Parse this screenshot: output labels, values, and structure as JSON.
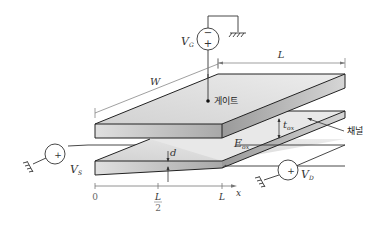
{
  "diagram": {
    "gate": {
      "label": "게이트",
      "source_label": "V",
      "source_subscript": "G",
      "source_polarity_top": "−",
      "source_polarity_bottom": "+"
    },
    "channel": {
      "label": "채널"
    },
    "source": {
      "label": "V",
      "subscript": "S",
      "polarity": "+"
    },
    "drain": {
      "label": "V",
      "subscript": "D",
      "polarity": "+"
    },
    "dimensions": {
      "width": "W",
      "length": "L",
      "oxide_thickness": "t",
      "oxide_thickness_sub": "ox",
      "oxide_field": "E",
      "oxide_field_sub": "ox",
      "channel_depth": "d"
    },
    "axis": {
      "variable": "x",
      "ticks": [
        {
          "label": "0"
        },
        {
          "label": "L",
          "denominator": "2"
        },
        {
          "label": "L"
        }
      ]
    },
    "colors": {
      "plate_top": "#e6e6e6",
      "plate_front": "#c9c9c9",
      "plate_side": "#8f8f8f",
      "edge": "#222222"
    }
  }
}
